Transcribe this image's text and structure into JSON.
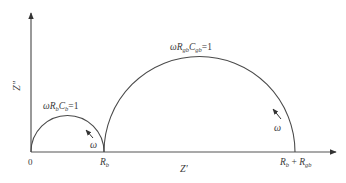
{
  "diagram": {
    "type": "nyquist-impedance-plot",
    "axes": {
      "y_label": "Z″",
      "x_label": "Z′",
      "origin_label": "0"
    },
    "semicircles": [
      {
        "name": "bulk",
        "condition_label_parts": [
          "ωR",
          "b",
          "C",
          "b",
          "=1"
        ],
        "frequency_label": "ω",
        "end_label": {
          "main": "R",
          "sub": "b"
        }
      },
      {
        "name": "grain-boundary",
        "condition_label_parts": [
          "ωR",
          "gb",
          "C",
          "gb",
          "=1"
        ],
        "frequency_label": "ω",
        "end_label": {
          "main1": "R",
          "sub1": "b",
          "plus": " + ",
          "main2": "R",
          "sub2": "gb"
        }
      }
    ],
    "colors": {
      "line": "#4a4a4a",
      "text": "#3a3a3a"
    }
  }
}
